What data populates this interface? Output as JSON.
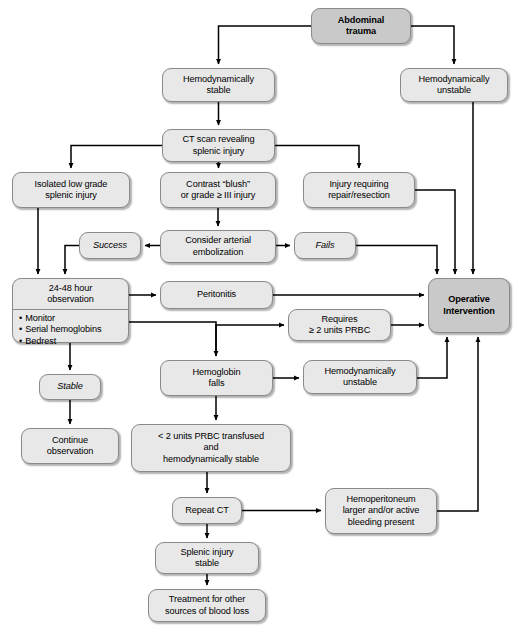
{
  "diagram": {
    "colors": {
      "node_fill": "#e8e8e8",
      "node_fill_emphasis": "#c9c9c9",
      "node_border": "#8a8a8a",
      "edge": "#000000",
      "background": "#ffffff"
    }
  },
  "nodes": [
    {
      "id": "abdominal-trauma",
      "label": "Abdominal\ntrauma",
      "style": "dark",
      "x": 311,
      "y": 8,
      "w": 100,
      "h": 36
    },
    {
      "id": "hemodynamically-stable",
      "label": "Hemodynamically\nstable",
      "style": "plain",
      "x": 162,
      "y": 68,
      "w": 113,
      "h": 34
    },
    {
      "id": "hemodynamically-unstable-top",
      "label": "Hemodynamically\nunstable",
      "style": "plain",
      "x": 400,
      "y": 68,
      "w": 108,
      "h": 34
    },
    {
      "id": "ct-scan",
      "label": "CT scan revealing\nsplenic injury",
      "style": "plain",
      "x": 162,
      "y": 129,
      "w": 113,
      "h": 33
    },
    {
      "id": "isolated-low-grade",
      "label": "Isolated low grade\nsplenic injury",
      "style": "plain",
      "x": 12,
      "y": 172,
      "w": 118,
      "h": 36
    },
    {
      "id": "contrast-blush",
      "label": "Contrast “blush”\nor grade ≥ III injury",
      "style": "plain",
      "x": 160,
      "y": 172,
      "w": 116,
      "h": 36
    },
    {
      "id": "injury-requiring-repair",
      "label": "Injury requiring\nrepair/resection",
      "style": "plain",
      "x": 303,
      "y": 172,
      "w": 112,
      "h": 36
    },
    {
      "id": "success",
      "label": "Success",
      "style": "italic",
      "x": 79,
      "y": 232,
      "w": 62,
      "h": 27
    },
    {
      "id": "consider-embolization",
      "label": "Consider arterial\nembolization",
      "style": "plain",
      "x": 160,
      "y": 230,
      "w": 116,
      "h": 33
    },
    {
      "id": "fails",
      "label": "Fails",
      "style": "italic",
      "x": 294,
      "y": 232,
      "w": 62,
      "h": 27
    },
    {
      "id": "observation",
      "label": "24-48 hour\nobservation",
      "style": "split",
      "x": 12,
      "y": 278,
      "w": 117,
      "h": 65,
      "bullets": [
        "Monitor",
        "Serial hemoglobins",
        "Bedrest"
      ]
    },
    {
      "id": "peritonitis",
      "label": "Peritonitis",
      "style": "plain",
      "x": 160,
      "y": 281,
      "w": 113,
      "h": 28
    },
    {
      "id": "operative-intervention",
      "label": "Operative\nIntervention",
      "style": "dark",
      "x": 428,
      "y": 278,
      "w": 82,
      "h": 55
    },
    {
      "id": "requires-2-units",
      "label": "Requires\n≥ 2 units PRBC",
      "style": "plain",
      "x": 288,
      "y": 309,
      "w": 103,
      "h": 32
    },
    {
      "id": "hemoglobin-falls",
      "label": "Hemoglobin\nfalls",
      "style": "plain",
      "x": 160,
      "y": 360,
      "w": 113,
      "h": 36
    },
    {
      "id": "hemodynamically-unstable-lower",
      "label": "Hemodynamically\nunstable",
      "style": "plain",
      "x": 303,
      "y": 360,
      "w": 114,
      "h": 34
    },
    {
      "id": "stable",
      "label": "Stable",
      "style": "italic",
      "x": 39,
      "y": 374,
      "w": 62,
      "h": 26
    },
    {
      "id": "continue-observation",
      "label": "Continue\nobservation",
      "style": "plain",
      "x": 21,
      "y": 428,
      "w": 98,
      "h": 36
    },
    {
      "id": "less-than-2-units",
      "label": "< 2 units PRBC transfused\nand\nhemodynamically stable",
      "style": "plain",
      "x": 131,
      "y": 424,
      "w": 160,
      "h": 48
    },
    {
      "id": "repeat-ct",
      "label": "Repeat CT",
      "style": "plain",
      "x": 172,
      "y": 497,
      "w": 70,
      "h": 27
    },
    {
      "id": "hemoperitoneum",
      "label": "Hemoperitoneum\nlarger and/or active\nbleeding present",
      "style": "plain",
      "x": 325,
      "y": 488,
      "w": 112,
      "h": 46
    },
    {
      "id": "splenic-injury-stable",
      "label": "Splenic injury\nstable",
      "style": "plain",
      "x": 155,
      "y": 542,
      "w": 104,
      "h": 32
    },
    {
      "id": "treatment-other",
      "label": "Treatment for other\nsources of blood loss",
      "style": "plain",
      "x": 148,
      "y": 589,
      "w": 118,
      "h": 33
    }
  ],
  "edges": [
    {
      "from": "abdominal-trauma",
      "to": "hemodynamically-stable"
    },
    {
      "from": "abdominal-trauma",
      "to": "hemodynamically-unstable-top"
    },
    {
      "from": "hemodynamically-stable",
      "to": "ct-scan"
    },
    {
      "from": "ct-scan",
      "to": "isolated-low-grade"
    },
    {
      "from": "ct-scan",
      "to": "contrast-blush"
    },
    {
      "from": "ct-scan",
      "to": "injury-requiring-repair"
    },
    {
      "from": "contrast-blush",
      "to": "consider-embolization"
    },
    {
      "from": "consider-embolization",
      "to": "success"
    },
    {
      "from": "consider-embolization",
      "to": "fails"
    },
    {
      "from": "success",
      "to": "observation"
    },
    {
      "from": "isolated-low-grade",
      "to": "observation"
    },
    {
      "from": "observation",
      "to": "peritonitis"
    },
    {
      "from": "observation",
      "to": "stable"
    },
    {
      "from": "observation",
      "to": "hemoglobin-falls"
    },
    {
      "from": "peritonitis",
      "to": "operative-intervention"
    },
    {
      "from": "fails",
      "to": "operative-intervention"
    },
    {
      "from": "injury-requiring-repair",
      "to": "operative-intervention"
    },
    {
      "from": "hemodynamically-unstable-top",
      "to": "operative-intervention"
    },
    {
      "from": "hemoglobin-falls",
      "to": "requires-2-units"
    },
    {
      "from": "requires-2-units",
      "to": "operative-intervention"
    },
    {
      "from": "hemoglobin-falls",
      "to": "hemodynamically-unstable-lower"
    },
    {
      "from": "hemodynamically-unstable-lower",
      "to": "operative-intervention"
    },
    {
      "from": "stable",
      "to": "continue-observation"
    },
    {
      "from": "hemoglobin-falls",
      "to": "less-than-2-units"
    },
    {
      "from": "less-than-2-units",
      "to": "repeat-ct"
    },
    {
      "from": "repeat-ct",
      "to": "hemoperitoneum"
    },
    {
      "from": "repeat-ct",
      "to": "splenic-injury-stable"
    },
    {
      "from": "hemoperitoneum",
      "to": "operative-intervention"
    },
    {
      "from": "splenic-injury-stable",
      "to": "treatment-other"
    }
  ]
}
